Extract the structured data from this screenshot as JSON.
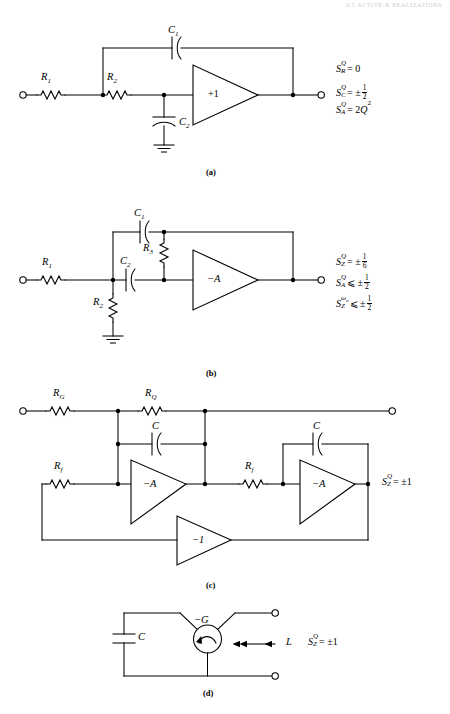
{
  "page": {
    "header_text": "6.5  ACTIVE-R REALIZATIONS",
    "header_page": "201",
    "width": 450,
    "height": 714,
    "background": "#ffffff",
    "ink": "#000000"
  },
  "figures": [
    {
      "id": "a",
      "caption": "(a)",
      "type": "sallen-key-lowpass",
      "amplifier_labels": [
        "+1"
      ],
      "component_labels": [
        {
          "name": "R1",
          "text": "R",
          "sub": "1"
        },
        {
          "name": "R2",
          "text": "R",
          "sub": "2"
        },
        {
          "name": "C1",
          "text": "C",
          "sub": "1"
        },
        {
          "name": "C2",
          "text": "C",
          "sub": "2"
        }
      ],
      "sensitivities": [
        {
          "symbol": "S",
          "subscript": "R",
          "superscript": "Q",
          "relation": "=",
          "value": "0"
        },
        {
          "symbol": "S",
          "subscript": "C",
          "superscript": "Q",
          "relation": "=",
          "value": "± 1/2",
          "value_sign": "±",
          "num": "1",
          "den": "2"
        },
        {
          "symbol": "S",
          "subscript": "A",
          "superscript": "Q",
          "relation": "=",
          "value": "2Q²",
          "coef": "2",
          "base": "Q",
          "exp": "2"
        }
      ]
    },
    {
      "id": "b",
      "caption": "(b)",
      "type": "multiple-feedback-bandpass",
      "amplifier_labels": [
        "−A"
      ],
      "component_labels": [
        {
          "name": "R1",
          "text": "R",
          "sub": "1"
        },
        {
          "name": "R2",
          "text": "R",
          "sub": "2"
        },
        {
          "name": "R3",
          "text": "R",
          "sub": "3"
        },
        {
          "name": "C1",
          "text": "C",
          "sub": "1"
        },
        {
          "name": "C2",
          "text": "C",
          "sub": "2"
        }
      ],
      "sensitivities": [
        {
          "symbol": "S",
          "subscript": "Z",
          "superscript": "Q",
          "relation": "=",
          "value_sign": "±",
          "num": "1",
          "den": "6"
        },
        {
          "symbol": "S",
          "subscript": "A",
          "superscript": "Q",
          "relation": "⩽",
          "value_sign": "±",
          "num": "1",
          "den": "2"
        },
        {
          "symbol": "S",
          "subscript": "Z",
          "superscript": "ωo",
          "relation": "⩽",
          "value_sign": "±",
          "num": "1",
          "den": "2"
        }
      ]
    },
    {
      "id": "c",
      "caption": "(c)",
      "type": "state-variable-biquad",
      "amplifier_labels": [
        "−A",
        "−A",
        "−1"
      ],
      "component_labels": [
        {
          "name": "RG",
          "text": "R",
          "sub": "G"
        },
        {
          "name": "RQ",
          "text": "R",
          "sub": "Q"
        },
        {
          "name": "C-left",
          "text": "C",
          "sub": ""
        },
        {
          "name": "C-right",
          "text": "C",
          "sub": ""
        },
        {
          "name": "Rf-left",
          "text": "R",
          "sub": "f"
        },
        {
          "name": "Rf-right",
          "text": "R",
          "sub": "f"
        }
      ],
      "sensitivities": [
        {
          "symbol": "S",
          "subscript": "Z",
          "superscript": "Q",
          "relation": "=",
          "value": "±1"
        }
      ]
    },
    {
      "id": "d",
      "caption": "(d)",
      "type": "negative-conductance-gyrator",
      "amplifier_labels": [
        "−G"
      ],
      "component_labels": [
        {
          "name": "C",
          "text": "C",
          "sub": ""
        },
        {
          "name": "L",
          "text": "L",
          "sub": ""
        }
      ],
      "annotations": [
        {
          "name": "inductance-arrow-label",
          "text": "L"
        }
      ],
      "sensitivities": [
        {
          "symbol": "S",
          "subscript": "Z",
          "superscript": "Q",
          "relation": "=",
          "value": "±1"
        }
      ]
    }
  ]
}
